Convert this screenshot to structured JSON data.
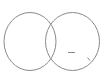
{
  "diagram": {
    "type": "venn",
    "background": "#ffffff",
    "stroke_color": "#8a8a8a",
    "sets": [
      {
        "name": "left-set",
        "cx": 30,
        "cy": 41.5,
        "rx": 26,
        "ry": 29
      },
      {
        "name": "right-set",
        "cx": 72.5,
        "cy": 41.5,
        "rx": 27,
        "ry": 29
      }
    ],
    "marks": [
      {
        "name": "dash-mark",
        "x1": 68,
        "y1": 52.5,
        "x2": 75,
        "y2": 52.5
      },
      {
        "name": "tick-mark",
        "x1": 87.5,
        "y1": 57.5,
        "x2": 90,
        "y2": 60.5
      }
    ]
  }
}
